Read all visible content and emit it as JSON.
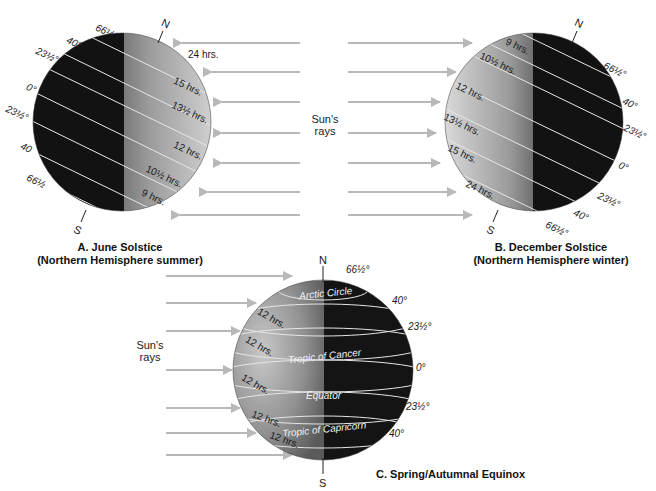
{
  "figure": {
    "sun_rays_label": "Sun's\nrays",
    "colors": {
      "ray": "#b8b8b8",
      "night": "#141414",
      "day": "#bdbdbd",
      "latitude_line": "#e8e8e8",
      "text": "#1a1a1a"
    }
  },
  "panel_a": {
    "caption_line1": "A. June Solstice",
    "caption_line2": "(Northern Hemisphere summer)",
    "pole_north": "N",
    "pole_south": "S",
    "latitudes": [
      "66½°",
      "40°",
      "23½°",
      "0°",
      "23½°",
      "40",
      "66½"
    ],
    "day_lengths": [
      "24 hrs.",
      "15 hrs.",
      "13½ hrs.",
      "12 hrs.",
      "10½ hrs.",
      "9 hrs."
    ],
    "rays_label_line1": "Sun's",
    "rays_label_line2": "rays"
  },
  "panel_b": {
    "caption_line1": "B. December Solstice",
    "caption_line2": "(Northern Hemisphere winter)",
    "pole_north": "N",
    "pole_south": "S",
    "latitudes": [
      "66½°",
      "40°",
      "23½°",
      "0°",
      "23½°",
      "40°",
      "66½°"
    ],
    "day_lengths": [
      "9 hrs.",
      "10½ hrs.",
      "12 hrs.",
      "13½ hrs.",
      "15 hrs.",
      "24 hrs."
    ]
  },
  "panel_c": {
    "caption": "C. Spring/Autumnal Equinox",
    "pole_north": "N",
    "pole_south": "S",
    "rays_label_line1": "Sun's",
    "rays_label_line2": "rays",
    "latitudes": [
      "66½°",
      "40°",
      "23½°",
      "0°",
      "23½°",
      "40°"
    ],
    "circle_names": [
      "Arctic Circle",
      "Tropic of Cancer",
      "Equator",
      "Tropic of Capricorn"
    ],
    "day_lengths": [
      "12 hrs.",
      "12 hrs.",
      "12 hrs.",
      "12 hrs.",
      "12 hrs."
    ]
  }
}
